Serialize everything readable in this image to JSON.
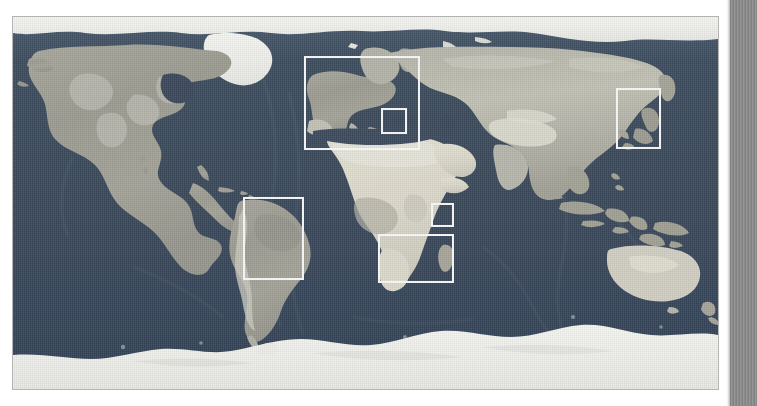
{
  "figure": {
    "kind": "world-relief-map",
    "projection": "equirectangular",
    "style_note": "grayscale shaded-relief world map, land mid-gray, ocean dark slate, polar ice white",
    "colors": {
      "ocean": "#3a4a5c",
      "ocean_deep": "#2f3e4e",
      "land_low": "#9a9a92",
      "land_mid": "#aeaea4",
      "land_high": "#cfcfc6",
      "desert": "#e2e0d4",
      "ice": "#f4f4f0",
      "roi_stroke": "#f2f2f2",
      "frame_border": "#b4b4b4",
      "gutter": "#8d8d8d",
      "page_background": "#ffffff"
    },
    "roi_boxes": [
      {
        "id": "roi-europe",
        "label": "Europe",
        "x": 291,
        "y": 39,
        "w": 116,
        "h": 94
      },
      {
        "id": "roi-italy",
        "label": "Italy",
        "x": 368,
        "y": 91,
        "w": 26,
        "h": 26
      },
      {
        "id": "roi-japan",
        "label": "Japan",
        "x": 603,
        "y": 71,
        "w": 45,
        "h": 61
      },
      {
        "id": "roi-south-america",
        "label": "South America",
        "x": 230,
        "y": 180,
        "w": 61,
        "h": 83
      },
      {
        "id": "roi-east-africa",
        "label": "East Africa",
        "x": 418,
        "y": 186,
        "w": 23,
        "h": 24
      },
      {
        "id": "roi-southern-africa",
        "label": "Southern Africa",
        "x": 365,
        "y": 217,
        "w": 76,
        "h": 49
      }
    ],
    "gutter": {
      "name": "page-edge-strip",
      "x": 730,
      "width": 27,
      "pattern": "vertical-stripes"
    }
  }
}
